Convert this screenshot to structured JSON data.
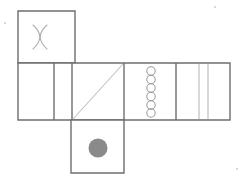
{
  "figure": {
    "background_color": "#ffffff",
    "stroke_color": "#6e6e6e",
    "light_stroke_color": "#b8b8b8",
    "fill_color": "#8a8a8a",
    "stroke_width": "1.4",
    "light_stroke_width": "1"
  },
  "geometry": {
    "cell_size": 57,
    "row_top_y": 11,
    "row_middle_y": 63,
    "row_bottom_y": 120,
    "origin_x": 18,
    "strip_width": 212,
    "middle_row_height": 57,
    "top_square_x": 18,
    "bottom_square_x": 71
  },
  "faces": [
    {
      "id": "face-top",
      "name": "top-face",
      "position": "top-left",
      "mark": "double-arc-x",
      "mark_label": "two opposing arcs forming an X / hourglass",
      "x": 18,
      "y": 11,
      "width": 57,
      "height": 52
    },
    {
      "id": "face-middle-1",
      "name": "middle-face-1",
      "position": "middle-row-column-1",
      "mark": "blank",
      "mark_label": "empty cell",
      "x": 18,
      "y": 63,
      "width": 36,
      "height": 57
    },
    {
      "id": "face-middle-2",
      "name": "middle-face-2",
      "position": "middle-row-column-2",
      "mark": "blank",
      "mark_label": "empty cell",
      "x": 54,
      "y": 63,
      "width": 18,
      "height": 57
    },
    {
      "id": "face-middle-3",
      "name": "middle-face-3",
      "position": "middle-row-column-3",
      "mark": "diagonal",
      "mark_label": "diagonal line from bottom-left to top-right",
      "x": 72,
      "y": 63,
      "width": 52,
      "height": 57
    },
    {
      "id": "face-middle-4",
      "name": "middle-face-4",
      "position": "middle-row-column-4",
      "mark": "circle-column",
      "mark_label": "vertical column of six small open circles",
      "circle_count": 6,
      "x": 124,
      "y": 63,
      "width": 52,
      "height": 57
    },
    {
      "id": "face-middle-5",
      "name": "middle-face-5",
      "position": "middle-row-column-5",
      "mark": "double-vertical-lines",
      "mark_label": "two thin vertical lines",
      "line_count": 2,
      "x": 176,
      "y": 63,
      "width": 54,
      "height": 57
    },
    {
      "id": "face-bottom",
      "name": "bottom-face",
      "position": "bottom-center",
      "mark": "filled-dot",
      "mark_label": "single filled gray dot",
      "x": 71,
      "y": 120,
      "width": 53,
      "height": 53
    }
  ],
  "marks": {
    "arc_x": {
      "name": "double-arc-x-mark",
      "left_arc": "M 47 25 C 38 33, 38 41, 47 49",
      "right_arc": "M 33 25 C 42 33, 42 41, 33 49",
      "cx": 40,
      "cy": 37
    },
    "diagonal": {
      "name": "diagonal-line-mark",
      "x1": 73,
      "y1": 119,
      "x2": 123,
      "y2": 64
    },
    "circles": {
      "name": "circle-column-mark",
      "cx": 151,
      "r": 4.2,
      "centers_y": [
        71,
        79.5,
        88,
        96.5,
        105,
        113
      ]
    },
    "vertical_lines": {
      "name": "double-vertical-line-mark",
      "x_positions": [
        199,
        208
      ],
      "y1": 64,
      "y2": 119
    },
    "dot": {
      "name": "filled-dot-mark",
      "cx": 98,
      "cy": 148,
      "r": 9.5
    }
  },
  "grid_lines": {
    "name": "net-grid-lines",
    "vertical_x": [
      54,
      72,
      124,
      176
    ],
    "outline_top_square": "M 18 11 L 75 11 L 75 63 L 18 63 Z",
    "outline_strip": "M 18 63 L 230 63 L 230 120 L 18 120 Z",
    "outline_bottom_square": "M 71 120 L 124 120 L 124 173 L 71 173 Z"
  },
  "specks": [
    {
      "name": "speck-top-left",
      "x": 4,
      "y": 22
    },
    {
      "name": "speck-top-right",
      "x": 214,
      "y": 6
    },
    {
      "name": "speck-bottom-right",
      "x": 236,
      "y": 168
    }
  ]
}
